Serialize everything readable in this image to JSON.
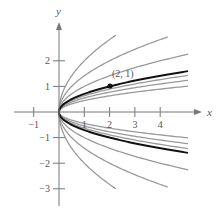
{
  "chart_data": {
    "type": "line",
    "title": "",
    "xlabel": "x",
    "ylabel": "y",
    "xlim": [
      -1.4,
      5.4
    ],
    "ylim": [
      -3.6,
      3.5
    ],
    "grid": false,
    "x_ticks": [
      -1,
      1,
      2,
      3,
      4
    ],
    "y_ticks": [
      2,
      1,
      -1,
      -2,
      -3
    ],
    "x_tick_labels": [
      "−1",
      "1",
      "2",
      "3",
      "4"
    ],
    "y_tick_labels": [
      "2",
      "1",
      "−1",
      "−2",
      "−3"
    ],
    "series": [
      {
        "name": "y^2 = 4x",
        "C": 4,
        "color": "#9a9a9a",
        "x_max": 2.25,
        "highlight": false
      },
      {
        "name": "y^2 = 2x",
        "C": 2,
        "color": "#9a9a9a",
        "x_max": 4.3,
        "highlight": false
      },
      {
        "name": "y^2 = x",
        "C": 1,
        "color": "#9a9a9a",
        "x_max": 5.1,
        "highlight": false
      },
      {
        "name": "y^2 = 0.5x",
        "C": 0.5,
        "color": "#111111",
        "x_max": 5.1,
        "highlight": true
      },
      {
        "name": "y^2 = 0.4x",
        "C": 0.4,
        "color": "#9a9a9a",
        "x_max": 5.1,
        "highlight": false
      },
      {
        "name": "y^2 = 0.3x",
        "C": 0.3,
        "color": "#9a9a9a",
        "x_max": 5.1,
        "highlight": false
      },
      {
        "name": "y^2 = 0.2x",
        "C": 0.2,
        "color": "#9a9a9a",
        "x_max": 5.1,
        "highlight": false
      }
    ],
    "annotations": [
      {
        "text": "(2, 1)",
        "x": 2,
        "y": 1,
        "marker": "dot"
      }
    ]
  },
  "labels": {
    "x_axis": "x",
    "y_axis": "y",
    "point": "(2, 1)",
    "ticks_x": [
      "−1",
      "1",
      "2",
      "3",
      "4"
    ],
    "ticks_y": [
      "2",
      "1",
      "−1",
      "−2",
      "−3"
    ]
  }
}
